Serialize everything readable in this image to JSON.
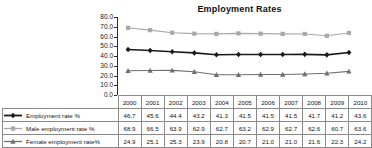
{
  "chart_data": {
    "type": "line",
    "title": "Employment Rates",
    "xlabel": "",
    "ylabel": "",
    "ylim": [
      0.0,
      80.0
    ],
    "ytick_step": 10.0,
    "ytick_labels": [
      "80.0",
      "70.0",
      "60.0",
      "50.0",
      "40.0",
      "30.0",
      "20.0",
      "10.0",
      "0.0"
    ],
    "grid": false,
    "legend_position": "data-table-left",
    "categories": [
      "2000",
      "2001",
      "2002",
      "2003",
      "2004",
      "2005",
      "2006",
      "2007",
      "2008",
      "2009",
      "2010"
    ],
    "series": [
      {
        "name": "Employment rate %",
        "marker": "diamond",
        "color": "#1a1a1a",
        "values": [
          46.7,
          45.6,
          44.4,
          43.2,
          41.3,
          41.5,
          41.5,
          41.5,
          41.7,
          41.2,
          43.6
        ]
      },
      {
        "name": "Male employment rate %",
        "marker": "square",
        "color": "#a8a8a8",
        "values": [
          68.9,
          66.5,
          63.9,
          62.9,
          62.7,
          63.2,
          62.9,
          62.7,
          62.6,
          60.7,
          63.6
        ]
      },
      {
        "name": "Female employment rate%",
        "marker": "triangle",
        "color": "#6e6e6e",
        "values": [
          24.9,
          25.1,
          25.3,
          23.9,
          20.8,
          20.7,
          21.0,
          21.0,
          21.6,
          22.3,
          24.2
        ]
      }
    ]
  },
  "table": {
    "year_header": [
      "2000",
      "2001",
      "2002",
      "2003",
      "2004",
      "2005",
      "2006",
      "2007",
      "2008",
      "2009",
      "2010"
    ],
    "rows": [
      {
        "label": "Employment rate %",
        "values": [
          "46.7",
          "45.6",
          "44.4",
          "43.2",
          "41.3",
          "41.5",
          "41.5",
          "41.5",
          "41.7",
          "41.2",
          "43.6"
        ]
      },
      {
        "label": "Male employment rate %",
        "values": [
          "68.9",
          "66.5",
          "63.9",
          "62.9",
          "62.7",
          "63.2",
          "62.9",
          "62.7",
          "62.6",
          "60.7",
          "63.6"
        ]
      },
      {
        "label": "Female employment rate%",
        "values": [
          "24.9",
          "25.1",
          "25.3",
          "23.9",
          "20.8",
          "20.7",
          "21.0",
          "21.0",
          "21.6",
          "22.3",
          "24.2"
        ]
      }
    ]
  },
  "colors": {
    "series_total": "#1a1a1a",
    "series_male": "#a8a8a8",
    "series_female": "#6e6e6e",
    "axis": "#2b2b2b",
    "table_border": "#8a8a8a",
    "background": "#ffffff"
  }
}
